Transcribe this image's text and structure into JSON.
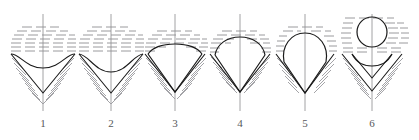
{
  "figure": {
    "title": "",
    "panel_count": 6,
    "colors": {
      "outline": "#1a1a1a",
      "hatch": "#9a9a9e",
      "liquid_dash": "#8e8e92",
      "axis": "#8a8a8e",
      "caption": "#57575a",
      "background": "#ffffff"
    },
    "baseline_y": 54,
    "axis_top": 14,
    "axis_bottom": 111
  },
  "panels": [
    {
      "id": "panel-1",
      "label": "1",
      "center_x": 43,
      "shape": "concave-meniscus-in-v-notch",
      "description": "Shallow concave meniscus dipping inside wide V notch",
      "meniscus_depth": 14,
      "notch_half_width": 28,
      "notch_depth": 32,
      "has_detached_bubble": false,
      "dash_rows": 8
    },
    {
      "id": "panel-2",
      "label": "2",
      "center_x": 111,
      "shape": "deeper-concave-meniscus-in-v-notch",
      "description": "Concave meniscus deeper, approaching notch apex",
      "meniscus_depth": 17,
      "notch_half_width": 28,
      "notch_depth": 32,
      "has_detached_bubble": false,
      "dash_rows": 8
    },
    {
      "id": "panel-3",
      "label": "3",
      "center_x": 175,
      "shape": "convex-dome-filling-notch",
      "description": "Convex bulge rising slightly over the baseline, filling the V",
      "dome_height": 10,
      "notch_half_width": 28,
      "notch_depth": 34,
      "has_detached_bubble": false,
      "dash_rows": 6
    },
    {
      "id": "panel-4",
      "label": "4",
      "center_x": 240,
      "shape": "rounded-dome-growing",
      "description": "Rounded dome grown taller above the baseline, pendant body below",
      "dome_height": 16,
      "notch_half_width": 26,
      "notch_depth": 36,
      "has_detached_bubble": false,
      "dash_rows": 5
    },
    {
      "id": "panel-5",
      "label": "5",
      "center_x": 305,
      "shape": "teardrop-necking",
      "description": "Pear/teardrop shaped body bulging above baseline, necking to a point",
      "dome_height": 26,
      "notch_half_width": 27,
      "notch_depth": 38,
      "has_detached_bubble": false,
      "dash_rows": 4
    },
    {
      "id": "panel-6",
      "label": "6",
      "center_x": 372,
      "shape": "detached-bubble-with-residual-notch",
      "description": "Bubble detached as a circle above; small residual meniscus in the V notch",
      "bubble_cx": 372,
      "bubble_cy": 32,
      "bubble_r": 15,
      "notch_half_width": 28,
      "notch_depth": 30,
      "has_detached_bubble": true,
      "dash_rows": 9
    }
  ]
}
